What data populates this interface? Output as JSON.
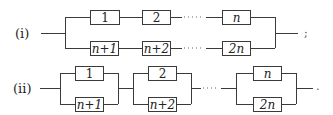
{
  "diagram": {
    "type": "reliability-block-diagram",
    "rows": [
      {
        "label": "(i)",
        "description": "two series chains in parallel",
        "top_chain": [
          "1",
          "2",
          "n"
        ],
        "bottom_chain": [
          "n+1",
          "n+2",
          "2n"
        ],
        "trailing_punct": ";"
      },
      {
        "label": "(ii)",
        "description": "parallel pairs connected in series",
        "pairs": [
          {
            "top": "1",
            "bottom": "n+1"
          },
          {
            "top": "2",
            "bottom": "n+2"
          },
          {
            "top": "n",
            "bottom": "2n"
          }
        ],
        "trailing_punct": "."
      }
    ],
    "ellipsis": "···"
  }
}
